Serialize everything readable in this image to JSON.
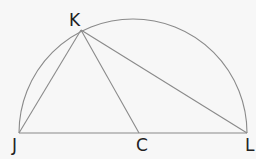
{
  "diagram": {
    "type": "geometry",
    "points": [
      {
        "name": "K",
        "label": "K",
        "x": 81,
        "y": 30
      },
      {
        "name": "J",
        "label": "J",
        "x": 19,
        "y": 133
      },
      {
        "name": "C",
        "label": "C",
        "x": 139,
        "y": 133
      },
      {
        "name": "L",
        "label": "L",
        "x": 247,
        "y": 133
      }
    ],
    "segments": [
      "JL",
      "KJ",
      "KC",
      "KL"
    ],
    "arc": {
      "from": "J",
      "to": "L",
      "type": "semicircle"
    },
    "colors": {
      "line": "#808080",
      "text": "#222222",
      "background": "#f7f7f7"
    }
  }
}
